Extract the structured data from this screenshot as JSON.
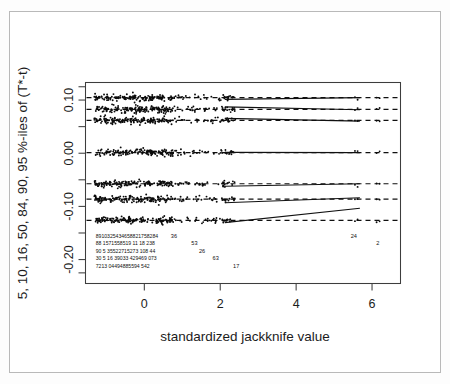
{
  "figure": {
    "kind": "r-jackknife-diagnostic-plot",
    "background_color": "#ffffff",
    "frame_color": "#b9b9b9",
    "ink_color": "#101010"
  },
  "axis_titles": {
    "x": "standardized jackknife value",
    "y": "5, 10, 16, 50, 84, 90, 95 %-iles of (T*-t)"
  },
  "chart_data": {
    "type": "scatter",
    "title": "",
    "xlabel": "standardized jackknife value",
    "ylabel": "5, 10, 16, 50, 84, 90, 95 %-iles of (T*-t)",
    "xlim": [
      -1.55,
      6.75
    ],
    "ylim": [
      -0.245,
      0.133
    ],
    "xticks": [
      0,
      2,
      4,
      6
    ],
    "xtick_labels": [
      "0",
      "2",
      "4",
      "6"
    ],
    "yticks": [
      0.1,
      0.0,
      -0.1,
      -0.2
    ],
    "ytick_labels": [
      "0.10",
      "0.00",
      "-0.10",
      "-0.20"
    ],
    "yticks_minor": [
      0.05,
      -0.05,
      -0.15
    ],
    "grid": false,
    "legend": null,
    "series": [
      {
        "name": "95 %-ile",
        "level": 95,
        "baseline": 0.1045,
        "dashed_reference": 0.1045,
        "trend_x": [
          2.12,
          5.68
        ],
        "trend_y": [
          0.1012,
          0.1045
        ],
        "point_color": "#0b0b0b"
      },
      {
        "name": "90 %-ile",
        "level": 90,
        "baseline": 0.0825,
        "dashed_reference": 0.0825,
        "trend_x": [
          2.12,
          5.68
        ],
        "trend_y": [
          0.0872,
          0.0818
        ],
        "point_color": "#0b0b0b"
      },
      {
        "name": "84 %-ile",
        "level": 84,
        "baseline": 0.0618,
        "dashed_reference": 0.0618,
        "trend_x": [
          2.12,
          5.68
        ],
        "trend_y": [
          0.0655,
          0.0605
        ],
        "point_color": "#0b0b0b"
      },
      {
        "name": "50 %-ile",
        "level": 50,
        "baseline": 0.0012,
        "dashed_reference": 0.0012,
        "trend_x": [
          2.12,
          5.68
        ],
        "trend_y": [
          0.0016,
          0.0012
        ],
        "point_color": "#0b0b0b"
      },
      {
        "name": "16 %-ile",
        "level": 16,
        "baseline": -0.0575,
        "dashed_reference": -0.0575,
        "trend_x": [
          2.12,
          5.68
        ],
        "trend_y": [
          -0.0622,
          -0.0575
        ],
        "point_color": "#0b0b0b"
      },
      {
        "name": "10 %-ile",
        "level": 10,
        "baseline": -0.0862,
        "dashed_reference": -0.0862,
        "trend_x": [
          2.12,
          5.68
        ],
        "trend_y": [
          -0.0932,
          -0.0838
        ],
        "point_color": "#0b0b0b"
      },
      {
        "name": "5 %-ile",
        "level": 5,
        "baseline": -0.1262,
        "dashed_reference": -0.1262,
        "trend_x": [
          2.12,
          5.68
        ],
        "trend_y": [
          -0.1305,
          -0.1035
        ],
        "point_color": "#0b0b0b"
      }
    ],
    "annotations": {
      "description": "Overplotted case-index labels printed below the point cloud, one text row per percentile band.",
      "rows": [
        {
          "row": 1,
          "y_value": -0.1595,
          "dense_cluster_text": "8910325434658821758284",
          "sparse": [
            {
              "label": "36",
              "x": 0.78
            },
            {
              "label": "24",
              "x": 5.52
            }
          ]
        },
        {
          "row": 2,
          "y_value": -0.1735,
          "dense_cluster_text": "88 1571558519 11 18 238",
          "sparse": [
            {
              "label": "53",
              "x": 1.32
            },
            {
              "label": "2",
              "x": 6.15
            }
          ]
        },
        {
          "row": 3,
          "y_value": -0.1875,
          "dense_cluster_text": "90 5 35522715273 108 44",
          "sparse": [
            {
              "label": "26",
              "x": 1.52
            }
          ]
        },
        {
          "row": 4,
          "y_value": -0.2015,
          "dense_cluster_text": "30 5 16 39033 429469 073",
          "sparse": [
            {
              "label": "63",
              "x": 1.88
            }
          ]
        },
        {
          "row": 5,
          "y_value": -0.2155,
          "dense_cluster_text": "7213 04494885594 542",
          "sparse": [
            {
              "label": "17",
              "x": 2.42
            }
          ]
        }
      ]
    }
  }
}
